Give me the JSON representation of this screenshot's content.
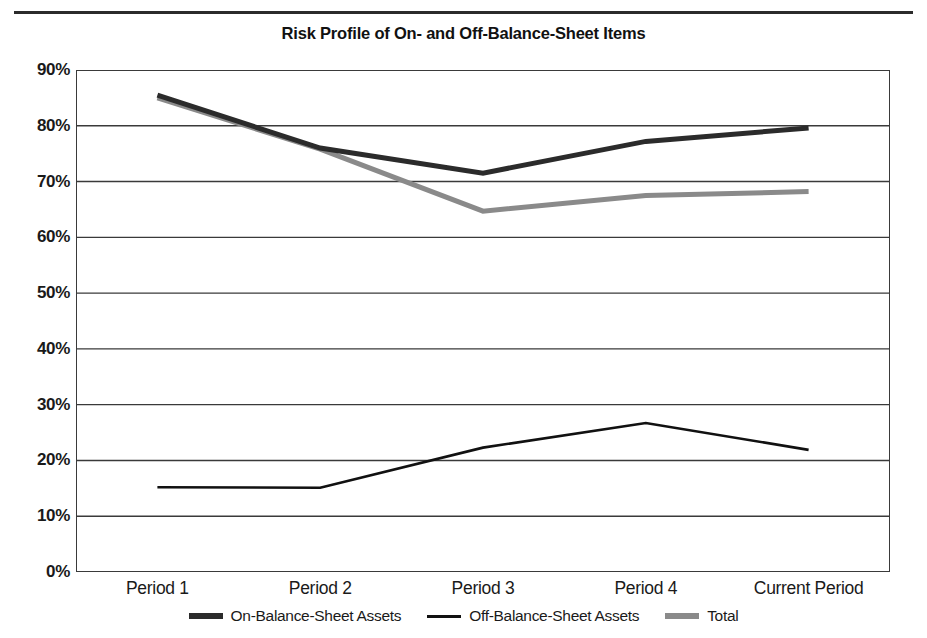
{
  "chart_data": {
    "type": "line",
    "title": "Risk Profile of On- and Off-Balance-Sheet Items",
    "xlabel": "",
    "ylabel": "",
    "categories": [
      "Period 1",
      "Period 2",
      "Period 3",
      "Period 4",
      "Current Period"
    ],
    "ylim": [
      0,
      90
    ],
    "ytick_values": [
      0,
      10,
      20,
      30,
      40,
      50,
      60,
      70,
      80,
      90
    ],
    "ytick_labels": [
      "0%",
      "10%",
      "20%",
      "30%",
      "40%",
      "50%",
      "60%",
      "70%",
      "80%",
      "90%"
    ],
    "grid": "horizontal",
    "legend_position": "bottom",
    "series": [
      {
        "name": "On-Balance-Sheet Assets",
        "values": [
          85.5,
          76.0,
          71.5,
          77.2,
          79.6
        ],
        "color": "#2b2b2b",
        "width": 5,
        "legend_style": "thick"
      },
      {
        "name": "Off-Balance-Sheet Assets",
        "values": [
          15.2,
          15.1,
          22.3,
          26.7,
          21.9
        ],
        "color": "#111111",
        "width": 2.6,
        "legend_style": "thin"
      },
      {
        "name": "Total",
        "values": [
          85.0,
          75.8,
          64.7,
          67.5,
          68.2
        ],
        "color": "#8a8a8a",
        "width": 5,
        "legend_style": "thick"
      }
    ]
  },
  "axes": {
    "axis_color": "#3a3a3a",
    "grid_color": "#3a3a3a",
    "background": "#ffffff"
  },
  "decor": {
    "top_rule_color": "#2b2b2b"
  }
}
